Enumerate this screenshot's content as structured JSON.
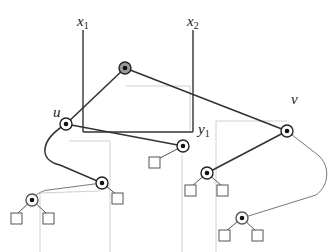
{
  "diagram": {
    "type": "tree-with-axes",
    "axes": {
      "x1": {
        "label": "x",
        "subscript": "1"
      },
      "x2": {
        "label": "x",
        "subscript": "2"
      },
      "y1": {
        "label": "y",
        "subscript": "1"
      }
    },
    "node_labels": {
      "u": "u",
      "v": "v"
    },
    "colors": {
      "edge_dark": "#333333",
      "edge_light": "#888888",
      "guide_line": "#cccccc",
      "root_fill": "#9a9a9a",
      "node_fill": "#ffffff",
      "dot": "#111111"
    },
    "nodes": [
      {
        "id": "root",
        "x": 125,
        "y": 68,
        "shaded": true
      },
      {
        "id": "u",
        "x": 66,
        "y": 124
      },
      {
        "id": "v",
        "x": 287,
        "y": 131
      },
      {
        "id": "n1",
        "x": 183,
        "y": 146
      },
      {
        "id": "n2",
        "x": 102,
        "y": 183
      },
      {
        "id": "n3",
        "x": 32,
        "y": 200
      },
      {
        "id": "n4",
        "x": 207,
        "y": 173
      },
      {
        "id": "n5",
        "x": 242,
        "y": 218
      }
    ],
    "leaves": [
      {
        "parent": "n1",
        "x": 155,
        "y": 162
      },
      {
        "parent": "n2",
        "x": 117,
        "y": 198
      },
      {
        "parent": "n3",
        "x": 16,
        "y": 218
      },
      {
        "parent": "n3",
        "x": 48,
        "y": 218
      },
      {
        "parent": "n4",
        "x": 190,
        "y": 190
      },
      {
        "parent": "n4",
        "x": 222,
        "y": 190
      },
      {
        "parent": "n5",
        "x": 224,
        "y": 235
      },
      {
        "parent": "n5",
        "x": 257,
        "y": 235
      }
    ]
  }
}
